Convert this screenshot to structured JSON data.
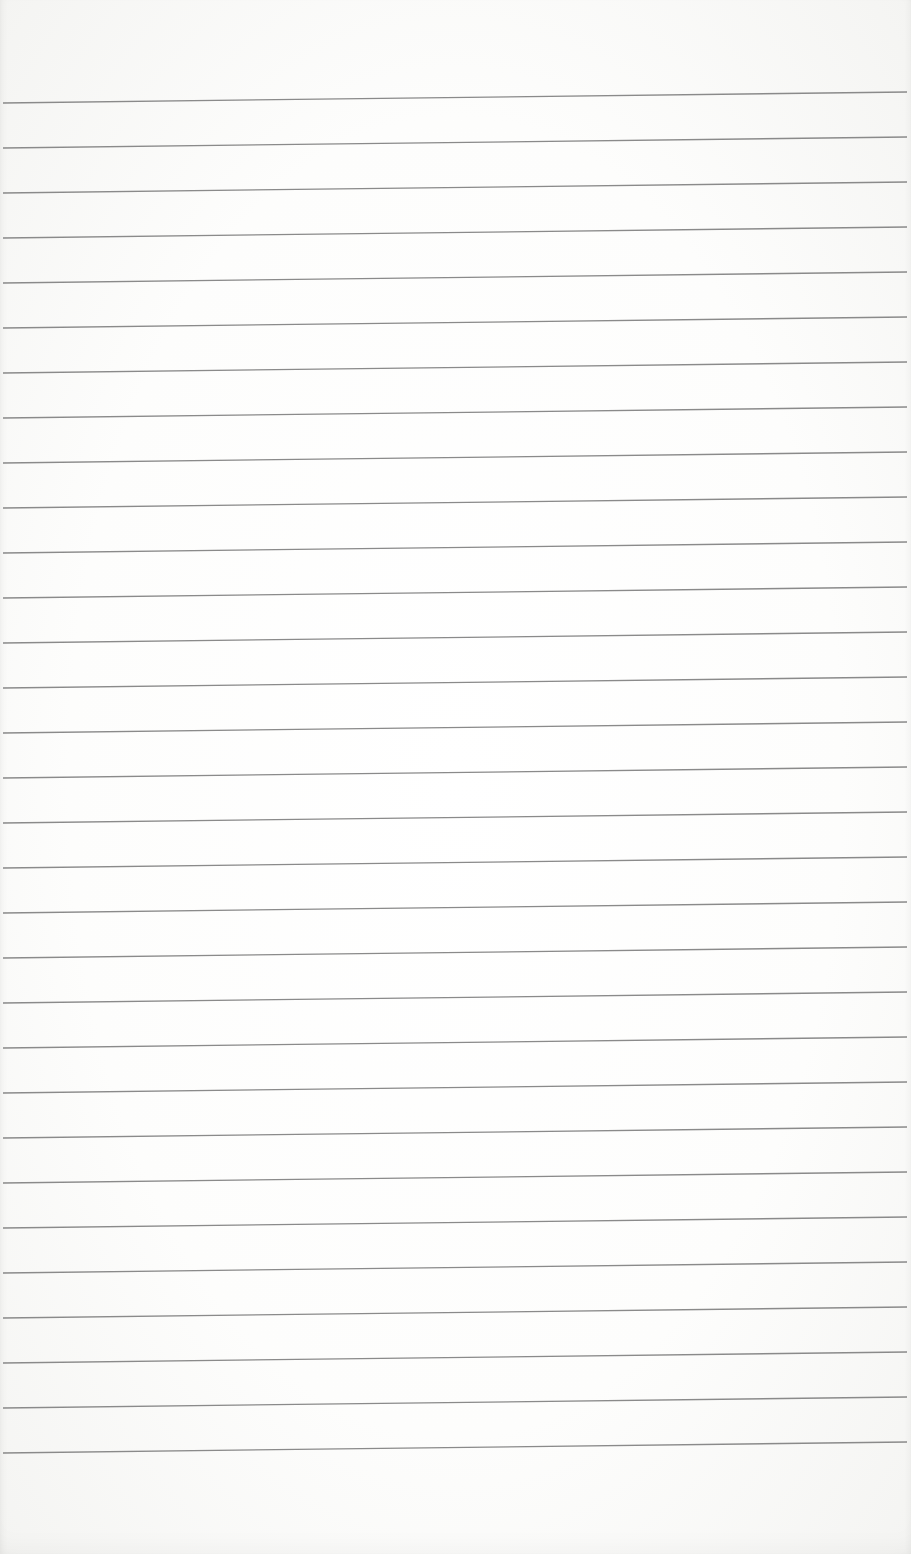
{
  "page": {
    "type": "lined-paper",
    "background_color": "#fcfcfb",
    "line_color": "#8a8a8a",
    "line_count": 31,
    "line_spacing_px": 45,
    "first_line_left_y": 103,
    "first_line_right_y": 92,
    "line_start_x": 3,
    "line_end_x": 907
  }
}
